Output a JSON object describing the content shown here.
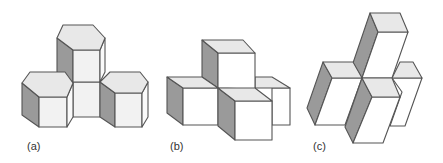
{
  "figure": {
    "panels": [
      {
        "id": "a",
        "label": "(a)",
        "shape": "hexagonal prisms",
        "count": 4
      },
      {
        "id": "b",
        "label": "(b)",
        "shape": "cubes",
        "count": 4
      },
      {
        "id": "c",
        "label": "(c)",
        "shape": "rhombic prisms",
        "count": 4
      }
    ]
  },
  "colors": {
    "stroke": "#555555",
    "top_face": "#e6e6e6",
    "front_face": "#f7f7f7",
    "side_face": "#9a9a9a",
    "background": "#ffffff"
  }
}
